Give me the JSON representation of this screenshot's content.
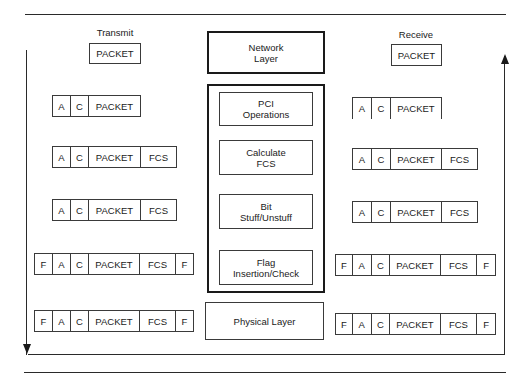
{
  "diagram": {
    "transmit": {
      "title": "Transmit",
      "top_packet": "PACKET",
      "frames": [
        {
          "fields": [
            "A",
            "C",
            "PACKET"
          ]
        },
        {
          "fields": [
            "A",
            "C",
            "PACKET",
            "FCS"
          ]
        },
        {
          "fields": [
            "A",
            "C",
            "PACKET",
            "FCS"
          ]
        },
        {
          "fields": [
            "F",
            "A",
            "C",
            "PACKET",
            "FCS",
            "F"
          ]
        },
        {
          "fields": [
            "F",
            "A",
            "C",
            "PACKET",
            "FCS",
            "F"
          ]
        }
      ]
    },
    "receive": {
      "title": "Receive",
      "top_packet": "PACKET",
      "frames": [
        {
          "fields": [
            "A",
            "C",
            "PACKET"
          ]
        },
        {
          "fields": [
            "A",
            "C",
            "PACKET",
            "FCS"
          ]
        },
        {
          "fields": [
            "A",
            "C",
            "PACKET",
            "FCS"
          ]
        },
        {
          "fields": [
            "F",
            "A",
            "C",
            "PACKET",
            "FCS",
            "F"
          ]
        },
        {
          "fields": [
            "F",
            "A",
            "C",
            "PACKET",
            "FCS",
            "F"
          ]
        }
      ]
    },
    "layers": {
      "network": {
        "line1": "Network",
        "line2": "Layer"
      },
      "stack": [
        {
          "line1": "PCI",
          "line2": "Operations"
        },
        {
          "line1": "Calculate",
          "line2": "FCS"
        },
        {
          "line1": "Bit",
          "line2": "Stuff/Unstuff"
        },
        {
          "line1": "Flag",
          "line2": "Insertion/Check"
        }
      ],
      "physical": "Physical Layer"
    }
  }
}
